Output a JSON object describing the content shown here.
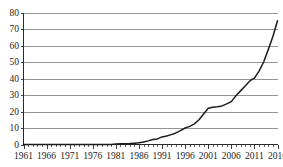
{
  "chart_data": {
    "type": "line",
    "title": "",
    "subtitle": "",
    "xlabel": "",
    "ylabel": "",
    "xlim": [
      1961,
      2016
    ],
    "ylim": [
      0,
      80
    ],
    "grid": true,
    "legend": null,
    "legend_position": "none",
    "y_ticks": [
      0,
      10,
      20,
      30,
      40,
      50,
      60,
      70,
      80
    ],
    "y_tick_labels": [
      "0",
      "10",
      "20",
      "30",
      "40",
      "50",
      "60",
      "70",
      "80"
    ],
    "x_tick_labels": [
      "1961",
      "1966",
      "1971",
      "1976",
      "1981",
      "1986",
      "1991",
      "1996",
      "2001",
      "2006",
      "2011",
      "2016"
    ],
    "x_major_ticks": [
      1961,
      1966,
      1971,
      1976,
      1981,
      1986,
      1991,
      1996,
      2001,
      2006,
      2011,
      2016
    ],
    "x_minor_tick_interval": 1,
    "line_color": "#1c1c1c",
    "grid_color": "#8a8a8a",
    "axis_color": "#2b2b2b",
    "series": [
      {
        "name": "value",
        "x": [
          1961,
          1962,
          1963,
          1964,
          1965,
          1966,
          1967,
          1968,
          1969,
          1970,
          1971,
          1972,
          1973,
          1974,
          1975,
          1976,
          1977,
          1978,
          1979,
          1980,
          1981,
          1982,
          1983,
          1984,
          1985,
          1986,
          1987,
          1988,
          1989,
          1990,
          1991,
          1992,
          1993,
          1994,
          1995,
          1996,
          1997,
          1998,
          1999,
          2000,
          2001,
          2002,
          2003,
          2004,
          2005,
          2006,
          2007,
          2008,
          2009,
          2010,
          2011,
          2012,
          2013,
          2014,
          2015,
          2016
        ],
        "values": [
          0,
          0,
          0,
          0,
          0,
          0,
          0,
          0,
          0,
          0,
          0,
          0,
          0,
          0,
          0,
          0,
          0,
          0,
          0,
          0,
          0.3,
          0.4,
          0.5,
          0.6,
          0.8,
          1.0,
          1.5,
          2.2,
          3.0,
          3.4,
          4.6,
          5.2,
          6.0,
          7.0,
          8.4,
          10.0,
          11.0,
          12.5,
          15.0,
          18.5,
          22.0,
          22.6,
          22.9,
          23.4,
          24.6,
          26.0,
          29.5,
          32.5,
          35.5,
          38.5,
          40.2,
          44.5,
          50.0,
          57.5,
          65.5,
          75.0
        ]
      }
    ]
  }
}
